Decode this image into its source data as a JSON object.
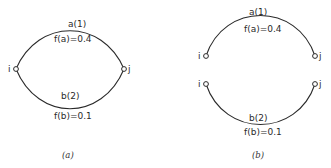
{
  "figure": {
    "panels": [
      {
        "caption": "(a)",
        "nodes": {
          "start": "i",
          "end": "j"
        },
        "arcs": [
          {
            "name": "a(1)",
            "flow": "f(a)=0.4"
          },
          {
            "name": "b(2)",
            "flow": "f(b)=0.1"
          }
        ]
      },
      {
        "caption": "(b)",
        "nodes": {
          "start": "i",
          "end": "j"
        },
        "arcs": [
          {
            "name": "a(1)",
            "flow": "f(a)=0.4"
          },
          {
            "name": "b(2)",
            "flow": "f(b)=0.1"
          }
        ]
      }
    ]
  }
}
